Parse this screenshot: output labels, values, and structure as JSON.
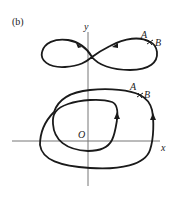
{
  "figure": {
    "panel_label": "(b)",
    "axes": {
      "x_label": "x",
      "y_label": "y",
      "origin_label": "O"
    },
    "upper_curve": {
      "shape": "figure-eight (lemniscate)",
      "point_labels": [
        "A",
        "B"
      ]
    },
    "lower_curve": {
      "shape": "spiral loop (two nested turns)",
      "point_labels": [
        "A",
        "B"
      ]
    },
    "colors": {
      "curve": "#1a1a1a",
      "axis": "#777777",
      "background": "#ffffff"
    }
  }
}
